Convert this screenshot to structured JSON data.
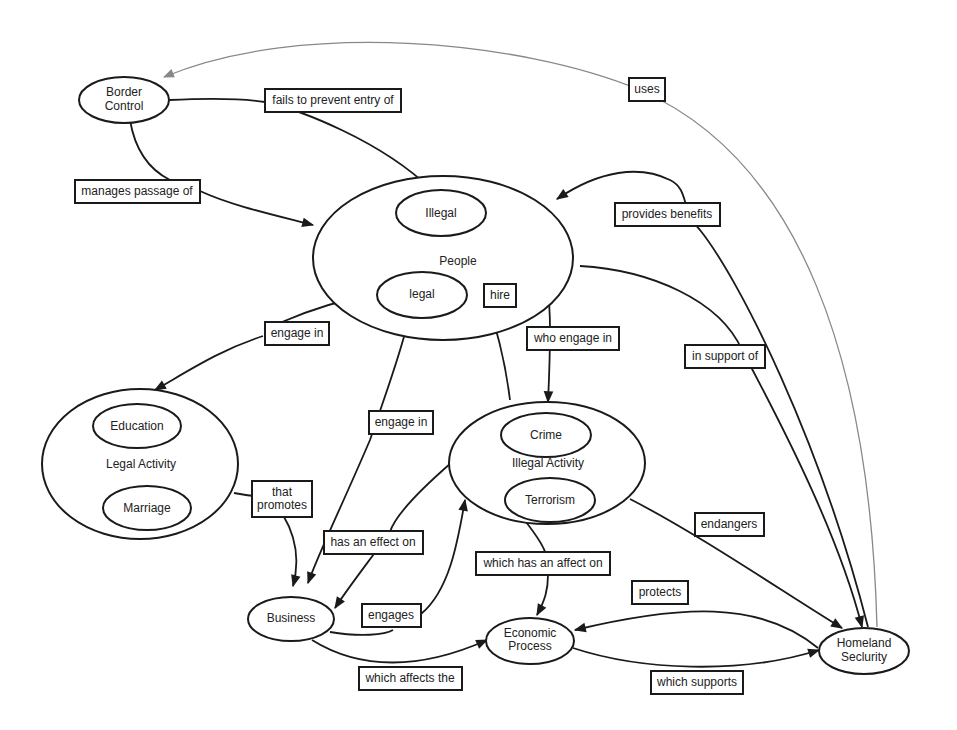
{
  "diagram": {
    "type": "concept-map",
    "colors": {
      "stroke": "#1a1a1a",
      "uses_edge": "#888888",
      "background": "#ffffff"
    },
    "nodes": {
      "border_control": {
        "line1": "Border",
        "line2": "Control"
      },
      "people": {
        "label": "People"
      },
      "illegal": {
        "label": "Illegal"
      },
      "legal": {
        "label": "legal"
      },
      "legal_activity": {
        "label": "Legal Activity"
      },
      "education": {
        "label": "Education"
      },
      "marriage": {
        "label": "Marriage"
      },
      "illegal_activity": {
        "label": "Illegal Activity"
      },
      "crime": {
        "label": "Crime"
      },
      "terrorism": {
        "label": "Terrorism"
      },
      "business": {
        "label": "Business"
      },
      "economic_process": {
        "line1": "Economic",
        "line2": "Process"
      },
      "homeland_security": {
        "line1": "Homeland",
        "line2": "Seclurity"
      }
    },
    "edges": {
      "fails_to_prevent": {
        "label": "fails to prevent entry of",
        "from": "Border Control",
        "to": "Illegal"
      },
      "manages_passage": {
        "label": "manages passage of",
        "from": "Border Control",
        "to": "People"
      },
      "uses": {
        "label": "uses",
        "from": "Homeland Seclurity",
        "to": "Border Control"
      },
      "provides_benefits": {
        "label": "provides benefits",
        "from": "Homeland Seclurity",
        "to": "People"
      },
      "hire": {
        "label": "hire",
        "from": "Business",
        "to": "Illegal"
      },
      "engage_in_legal": {
        "label": "engage in",
        "from": "legal",
        "to": "Legal Activity"
      },
      "who_engage_in": {
        "label": "who engage in",
        "from": "Illegal",
        "to": "Illegal Activity"
      },
      "in_support_of": {
        "label": "in support of",
        "from": "People",
        "to": "Homeland Seclurity"
      },
      "engage_in_business": {
        "label": "engage in",
        "from": "People",
        "to": "Business"
      },
      "that_promotes": {
        "line1": "that",
        "line2": "promotes",
        "from": "Legal Activity",
        "to": "Business"
      },
      "has_an_effect_on": {
        "label": "has an effect on",
        "from": "Illegal Activity",
        "to": "Business"
      },
      "engages": {
        "label": "engages",
        "from": "Business",
        "to": "Illegal Activity"
      },
      "endangers": {
        "label": "endangers",
        "from": "Illegal Activity",
        "to": "Homeland Seclurity"
      },
      "which_has_an_affect_on": {
        "label": "which has an affect on",
        "from": "Terrorism",
        "to": "Economic Process"
      },
      "protects": {
        "label": "protects",
        "from": "Homeland Seclurity",
        "to": "Economic Process"
      },
      "which_affects_the": {
        "label": "which affects the",
        "from": "Business",
        "to": "Economic Process"
      },
      "which_supports": {
        "label": "which supports",
        "from": "Economic Process",
        "to": "Homeland Seclurity"
      }
    }
  }
}
